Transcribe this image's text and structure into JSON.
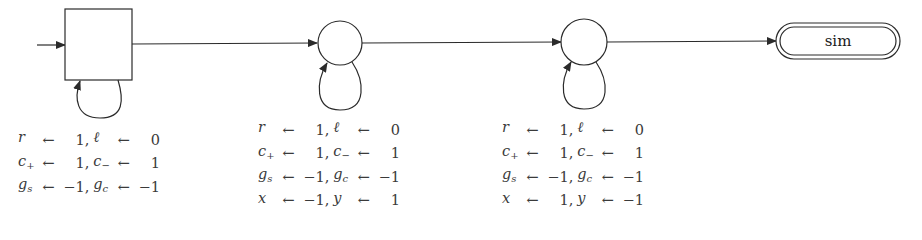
{
  "diagram": {
    "type": "state-machine",
    "nodes": [
      {
        "id": "start",
        "shape": "square",
        "label": ""
      },
      {
        "id": "state1",
        "shape": "circle",
        "label": ""
      },
      {
        "id": "state2",
        "shape": "circle",
        "label": ""
      },
      {
        "id": "final",
        "shape": "double-rounded-rectangle",
        "label": "sim"
      }
    ],
    "edges": [
      {
        "from": "entry",
        "to": "start"
      },
      {
        "from": "start",
        "to": "start",
        "kind": "self-loop"
      },
      {
        "from": "start",
        "to": "state1"
      },
      {
        "from": "state1",
        "to": "state1",
        "kind": "self-loop"
      },
      {
        "from": "state1",
        "to": "state2"
      },
      {
        "from": "state2",
        "to": "state2",
        "kind": "self-loop"
      },
      {
        "from": "state2",
        "to": "final"
      }
    ],
    "assignments": [
      {
        "node": "start",
        "rows": [
          {
            "v1": "r",
            "v1sub": "",
            "val1": "1",
            "v2": "ℓ",
            "v2sub": "",
            "val2": "0"
          },
          {
            "v1": "c",
            "v1sub": "+",
            "val1": "1",
            "v2": "c",
            "v2sub": "−",
            "val2": "1"
          },
          {
            "v1": "g",
            "v1sub": "s",
            "val1": "−1",
            "v2": "g",
            "v2sub": "c",
            "val2": "−1"
          }
        ]
      },
      {
        "node": "state1",
        "rows": [
          {
            "v1": "r",
            "v1sub": "",
            "val1": "1",
            "v2": "ℓ",
            "v2sub": "",
            "val2": "0"
          },
          {
            "v1": "c",
            "v1sub": "+",
            "val1": "1",
            "v2": "c",
            "v2sub": "−",
            "val2": "1"
          },
          {
            "v1": "g",
            "v1sub": "s",
            "val1": "−1",
            "v2": "g",
            "v2sub": "c",
            "val2": "−1"
          },
          {
            "v1": "x",
            "v1sub": "",
            "val1": "−1",
            "v2": "y",
            "v2sub": "",
            "val2": "1"
          }
        ]
      },
      {
        "node": "state2",
        "rows": [
          {
            "v1": "r",
            "v1sub": "",
            "val1": "1",
            "v2": "ℓ",
            "v2sub": "",
            "val2": "0"
          },
          {
            "v1": "c",
            "v1sub": "+",
            "val1": "1",
            "v2": "c",
            "v2sub": "−",
            "val2": "1"
          },
          {
            "v1": "g",
            "v1sub": "s",
            "val1": "−1",
            "v2": "g",
            "v2sub": "c",
            "val2": "−1"
          },
          {
            "v1": "x",
            "v1sub": "",
            "val1": "1",
            "v2": "y",
            "v2sub": "",
            "val2": "−1"
          }
        ]
      }
    ],
    "arrow_symbol": "←",
    "separator": ","
  }
}
